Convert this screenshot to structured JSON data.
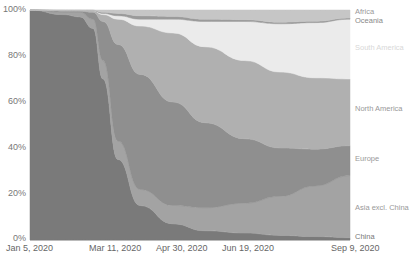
{
  "chart_data": {
    "type": "area",
    "stacked": true,
    "normalized": true,
    "title": "",
    "xlabel": "",
    "ylabel": "",
    "ylim": [
      0,
      100
    ],
    "y_ticks": [
      "0%",
      "20%",
      "40%",
      "60%",
      "80%",
      "100%"
    ],
    "x_ticks": [
      "Jan 5, 2020",
      "Mar 11, 2020",
      "Apr 30, 2020",
      "Jun 19, 2020",
      "Sep 9, 2020"
    ],
    "grid": false,
    "legend_position": "right-inline",
    "x": [
      "Jan 5, 2020",
      "Feb 1, 2020",
      "Feb 20, 2020",
      "Mar 1, 2020",
      "Mar 11, 2020",
      "Mar 25, 2020",
      "Apr 10, 2020",
      "Apr 30, 2020",
      "May 20, 2020",
      "Jun 19, 2020",
      "Jul 15, 2020",
      "Aug 10, 2020",
      "Sep 9, 2020"
    ],
    "series": [
      {
        "name": "China",
        "color": "#7a7a7a",
        "values": [
          100,
          98,
          97,
          92,
          70,
          35,
          15,
          7,
          4,
          3,
          2,
          1.5,
          1
        ]
      },
      {
        "name": "Asia excl. China",
        "color": "#a3a3a3",
        "values": [
          0,
          1,
          2,
          4,
          8,
          8,
          7,
          8,
          10,
          13,
          17,
          22,
          27
        ]
      },
      {
        "name": "Europe",
        "color": "#8f8f8f",
        "values": [
          0,
          0.5,
          0.5,
          3,
          17,
          42,
          50,
          45,
          37,
          28,
          21,
          16,
          13
        ]
      },
      {
        "name": "North America",
        "color": "#b0b0b0",
        "values": [
          0,
          0.3,
          0.3,
          0.7,
          3,
          11,
          21,
          30,
          33,
          34,
          33,
          31,
          29
        ]
      },
      {
        "name": "South America",
        "color": "#ebebeb",
        "values": [
          0,
          0,
          0,
          0,
          0.5,
          1.5,
          3,
          6,
          11,
          17,
          21,
          24,
          26
        ]
      },
      {
        "name": "Oceania",
        "color": "#9a9a9a",
        "values": [
          0,
          0.1,
          0.1,
          0.2,
          0.5,
          1,
          1.5,
          1.2,
          1,
          0.8,
          0.7,
          0.6,
          0.5
        ]
      },
      {
        "name": "Africa",
        "color": "#c6c6c6",
        "values": [
          0,
          0.1,
          0.1,
          0.1,
          1,
          1.5,
          2.5,
          2.8,
          4,
          4.2,
          5.3,
          4.9,
          3.5
        ]
      }
    ]
  },
  "labels": {
    "y": [
      "100%",
      "80%",
      "60%",
      "40%",
      "20%",
      "0%"
    ],
    "x": [
      "Jan 5, 2020",
      "Mar 11, 2020",
      "Apr 30, 2020",
      "Jun 19, 2020",
      "Sep 9, 2020"
    ],
    "series": [
      "Africa",
      "Oceania",
      "South America",
      "North America",
      "Europe",
      "Asia excl. China",
      "China"
    ]
  }
}
